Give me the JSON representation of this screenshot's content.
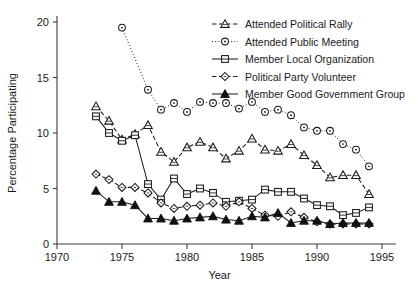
{
  "chart_data": {
    "type": "line",
    "title": "",
    "xlabel": "Year",
    "ylabel": "Percentage Participating",
    "xlim": [
      1970,
      1995
    ],
    "ylim": [
      0,
      20
    ],
    "xticks": [
      1970,
      1975,
      1980,
      1985,
      1990,
      1995
    ],
    "yticks": [
      0,
      5,
      10,
      15,
      20
    ],
    "grid": false,
    "legend_position": "top-right",
    "series": [
      {
        "name": "Attended Political Rally",
        "marker": "triangle-open",
        "linestyle": "dashed",
        "x": [
          1973,
          1974,
          1975,
          1976,
          1977,
          1978,
          1979,
          1980,
          1981,
          1982,
          1983,
          1984,
          1985,
          1986,
          1987,
          1988,
          1989,
          1990,
          1991,
          1992,
          1993,
          1994
        ],
        "values": [
          12.4,
          11.1,
          9.4,
          9.9,
          10.7,
          8.3,
          7.4,
          8.7,
          9.2,
          8.7,
          7.7,
          8.4,
          9.5,
          8.5,
          8.4,
          9.0,
          8.0,
          7.1,
          6.0,
          6.2,
          6.2,
          4.5
        ]
      },
      {
        "name": "Attended Public Meeting",
        "marker": "circle-open",
        "linestyle": "dotted",
        "x": [
          1975,
          1977,
          1978,
          1979,
          1980,
          1981,
          1982,
          1983,
          1984,
          1985,
          1986,
          1987,
          1988,
          1989,
          1990,
          1991,
          1992,
          1993,
          1994
        ],
        "values": [
          19.5,
          13.9,
          12.1,
          12.7,
          11.9,
          12.8,
          12.7,
          12.7,
          12.2,
          12.8,
          11.9,
          12.1,
          11.6,
          10.5,
          10.2,
          10.2,
          9.0,
          8.5,
          7.0
        ]
      },
      {
        "name": "Member Local Organization",
        "marker": "square-open",
        "linestyle": "solid",
        "x": [
          1973,
          1974,
          1975,
          1976,
          1977,
          1978,
          1979,
          1980,
          1981,
          1982,
          1983,
          1984,
          1985,
          1986,
          1987,
          1988,
          1989,
          1990,
          1991,
          1992,
          1993,
          1994
        ],
        "values": [
          11.5,
          10.0,
          9.3,
          9.8,
          5.4,
          4.0,
          5.9,
          4.5,
          5.0,
          4.6,
          3.8,
          3.9,
          4.0,
          4.9,
          4.7,
          4.7,
          4.1,
          3.5,
          3.4,
          2.6,
          2.8,
          3.3
        ]
      },
      {
        "name": "Political Party Volunteer",
        "marker": "diamond-open",
        "linestyle": "dashed",
        "x": [
          1973,
          1974,
          1975,
          1976,
          1977,
          1978,
          1979,
          1980,
          1981,
          1982,
          1983,
          1984,
          1985,
          1986,
          1987,
          1988,
          1989,
          1990,
          1991,
          1992,
          1993,
          1994
        ],
        "values": [
          6.3,
          5.8,
          5.1,
          5.1,
          4.6,
          3.7,
          3.2,
          3.4,
          3.5,
          3.7,
          3.4,
          3.8,
          3.2,
          2.6,
          2.5,
          2.9,
          2.4,
          2.0,
          1.8,
          1.8,
          1.8,
          1.8
        ]
      },
      {
        "name": "Member Good Government Group",
        "marker": "triangle-filled",
        "linestyle": "solid",
        "x": [
          1973,
          1974,
          1975,
          1976,
          1977,
          1978,
          1979,
          1980,
          1981,
          1982,
          1983,
          1984,
          1985,
          1986,
          1987,
          1988,
          1989,
          1990,
          1991,
          1992,
          1993,
          1994
        ],
        "values": [
          4.8,
          3.8,
          3.8,
          3.5,
          2.3,
          2.3,
          2.1,
          2.3,
          2.4,
          2.5,
          2.2,
          2.1,
          2.5,
          2.4,
          2.8,
          1.9,
          2.1,
          2.1,
          1.8,
          1.9,
          1.9,
          1.9
        ]
      }
    ]
  },
  "axes": {
    "y_label": "Percentage Participating",
    "x_label": "Year",
    "y_tick_labels": [
      "0",
      "5",
      "10",
      "15",
      "20"
    ],
    "x_tick_labels": [
      "1970",
      "1975",
      "1980",
      "1985",
      "1990",
      "1995"
    ]
  },
  "legend": {
    "entries": [
      {
        "label": "Attended Political Rally",
        "marker": "triangle-open",
        "linestyle": "dashed"
      },
      {
        "label": "Attended Public Meeting",
        "marker": "circle-open",
        "linestyle": "dotted"
      },
      {
        "label": "Member Local Organization",
        "marker": "square-open",
        "linestyle": "solid"
      },
      {
        "label": "Political Party Volunteer",
        "marker": "diamond-open",
        "linestyle": "dashed"
      },
      {
        "label": "Member Good Government Group",
        "marker": "triangle-filled",
        "linestyle": "solid"
      }
    ]
  },
  "colors": {
    "ink": "#1a1a1a",
    "axis": "#3c3c3c",
    "background": "#ffffff"
  }
}
